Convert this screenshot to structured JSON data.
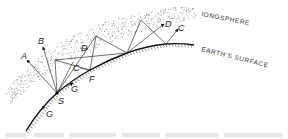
{
  "diagram": {
    "layers": {
      "ionosphere_label": "IONOSPHERE",
      "surface_label": "EARTH'S SURFACE"
    },
    "points": {
      "source": "S",
      "bounce": "F"
    },
    "rays": {
      "escaping_1": "A",
      "escaping_2": "B",
      "reflected_1": "C",
      "reflected_2": "D",
      "reflected_1_far": "C",
      "reflected_2_far": "D"
    },
    "ground_waves": {
      "forward": "G",
      "backward": "G"
    },
    "caption_visible": true
  }
}
